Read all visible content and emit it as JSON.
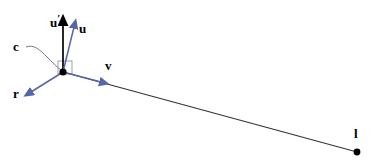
{
  "figure": {
    "background_color": "#ffffff",
    "vector_color": "#5566aa",
    "axis_color": "#000000",
    "line_color": "#333333"
  },
  "points": {
    "origin": {
      "name": "c",
      "x": 63,
      "y": 72
    },
    "target": {
      "name": "l",
      "x": 357,
      "y": 152
    }
  },
  "labels": {
    "u_prime": "u",
    "u_prime_mark": "′",
    "u": "u",
    "v": "v",
    "r": "r",
    "c": "c",
    "l": "l"
  },
  "vectors": [
    {
      "name": "u-prime",
      "label": "u′",
      "color": "#000000",
      "from_x": 63,
      "from_y": 72,
      "to_x": 63,
      "to_y": 20
    },
    {
      "name": "u",
      "label": "u",
      "color": "#5566aa",
      "from_x": 63,
      "from_y": 72,
      "to_x": 75,
      "to_y": 23
    },
    {
      "name": "v",
      "label": "v",
      "color": "#5566aa",
      "from_x": 63,
      "from_y": 72,
      "to_x": 105,
      "to_y": 83
    },
    {
      "name": "r",
      "label": "r",
      "color": "#5566aa",
      "from_x": 63,
      "from_y": 72,
      "to_x": 28,
      "to_y": 94
    }
  ],
  "ray": {
    "name": "sight-line",
    "color": "#333333",
    "from_x": 63,
    "from_y": 72,
    "to_x": 357,
    "to_y": 152
  },
  "right_angle_marker": {
    "name": "right-angle-square",
    "x": 63,
    "y": 67,
    "size": 12
  },
  "leader": {
    "name": "c-leader-line",
    "from_x": 26,
    "from_y": 48,
    "to_x": 62,
    "to_y": 70
  }
}
